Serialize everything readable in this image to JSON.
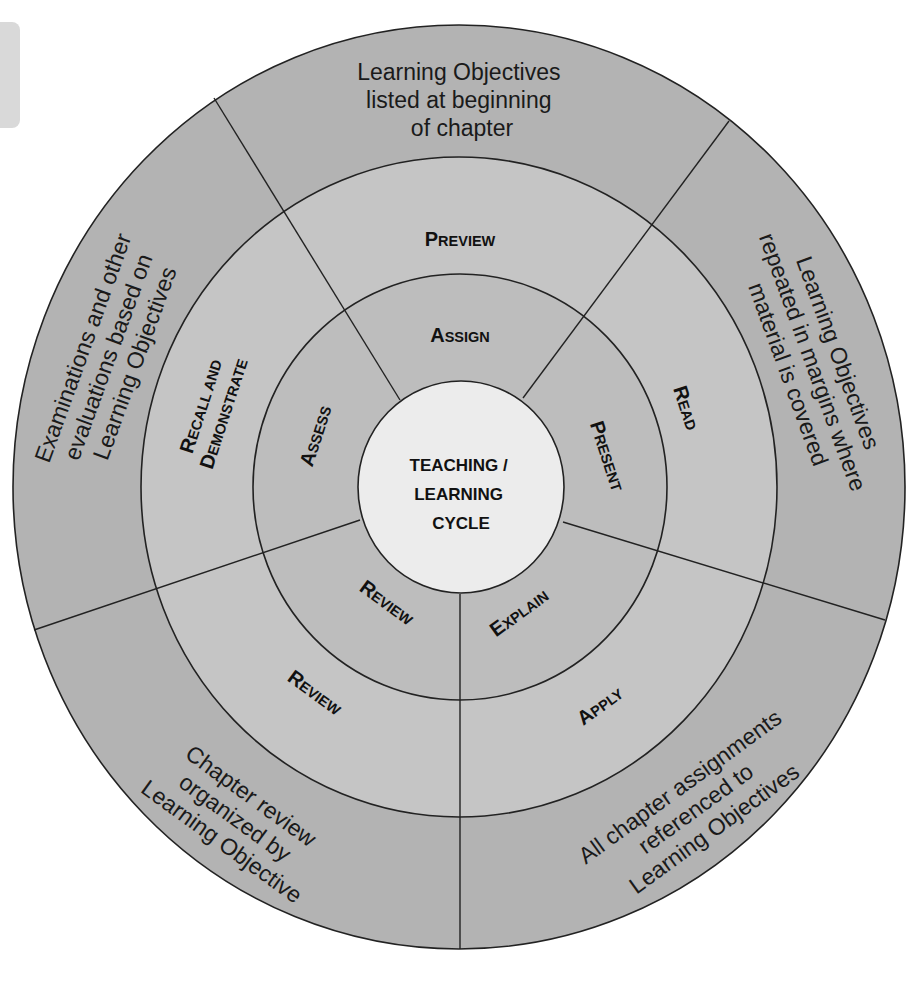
{
  "title": "Teaching / Learning Cycle",
  "colors": {
    "outer_ring": "#b3b3b3",
    "middle_ring": "#c5c5c5",
    "inner_ring": "#bdbdbd",
    "center": "#ececec",
    "lines": "#222222",
    "text": "#111111"
  },
  "center": {
    "lines": [
      "TEACHING /",
      "LEARNING",
      "CYCLE"
    ]
  },
  "inner_ring": [
    {
      "id": "assign",
      "cap": "A",
      "rest": "SSIGN"
    },
    {
      "id": "present",
      "cap": "P",
      "rest": "RESENT"
    },
    {
      "id": "explain",
      "cap": "E",
      "rest": "XPLAIN"
    },
    {
      "id": "review",
      "cap": "R",
      "rest": "EVIEW"
    },
    {
      "id": "assess",
      "cap": "A",
      "rest": "SSESS"
    }
  ],
  "middle_ring": [
    {
      "id": "preview",
      "lines": [
        {
          "cap": "P",
          "rest": "REVIEW"
        }
      ]
    },
    {
      "id": "read",
      "lines": [
        {
          "cap": "R",
          "rest": "EAD"
        }
      ]
    },
    {
      "id": "apply",
      "lines": [
        {
          "cap": "A",
          "rest": "PPLY"
        }
      ]
    },
    {
      "id": "review",
      "lines": [
        {
          "cap": "R",
          "rest": "EVIEW"
        }
      ]
    },
    {
      "id": "recall-demonstrate",
      "lines": [
        {
          "cap": "R",
          "rest": "ECALL AND"
        },
        {
          "cap": "D",
          "rest": "EMONSTRATE"
        }
      ]
    }
  ],
  "outer_ring": [
    {
      "id": "top",
      "lines": [
        "Learning Objectives",
        "listed at beginning",
        "of chapter"
      ]
    },
    {
      "id": "right",
      "lines": [
        "Learning Objectives",
        "repeated in margins where",
        "material is covered"
      ]
    },
    {
      "id": "bottom-right",
      "lines": [
        "All chapter assignments",
        "referenced to",
        "Learning Objectives"
      ]
    },
    {
      "id": "bottom-left",
      "lines": [
        "Chapter review",
        "organized by",
        "Learning Objective"
      ]
    },
    {
      "id": "left",
      "lines": [
        "Examinations and other",
        "evaluations based on",
        "Learning Objectives"
      ]
    }
  ]
}
